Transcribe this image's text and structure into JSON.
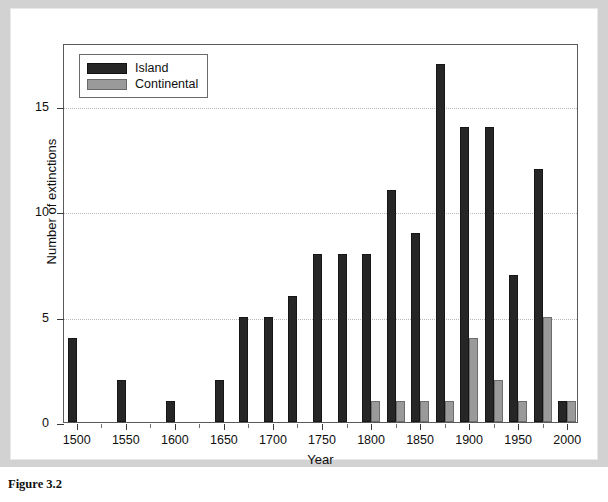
{
  "figure": {
    "caption": "Figure 3.2"
  },
  "chart_data": {
    "type": "bar",
    "title": "",
    "xlabel": "Year",
    "ylabel": "Number of extinctions",
    "ylim": [
      0,
      18
    ],
    "yticks": [
      0,
      5,
      10,
      15
    ],
    "ytick_labels": [
      "0",
      "5",
      "10",
      "15"
    ],
    "xlim": [
      1487,
      2012
    ],
    "xticks": [
      1500,
      1550,
      1600,
      1650,
      1700,
      1750,
      1800,
      1850,
      1900,
      1950,
      2000
    ],
    "xtick_labels": [
      "1500",
      "1550",
      "1600",
      "1650",
      "1700",
      "1750",
      "1800",
      "1850",
      "1900",
      "1950",
      "2000"
    ],
    "xminor_ticks": [
      1525,
      1575,
      1625,
      1675,
      1725,
      1775,
      1825,
      1875,
      1925,
      1975
    ],
    "grid": "horizontal-dotted",
    "legend_position": "top-left",
    "bin_width": 25,
    "categories": [
      1500,
      1525,
      1550,
      1575,
      1600,
      1625,
      1650,
      1675,
      1700,
      1725,
      1750,
      1775,
      1800,
      1825,
      1850,
      1875,
      1900,
      1925,
      1950,
      1975,
      2000
    ],
    "series": [
      {
        "name": "Island",
        "color": "#262626",
        "values": [
          4,
          0,
          2,
          0,
          1,
          0,
          2,
          5,
          5,
          6,
          8,
          8,
          8,
          11,
          9,
          17,
          14,
          14,
          7,
          12,
          1
        ]
      },
      {
        "name": "Continental",
        "color": "#9a9a9a",
        "values": [
          0,
          0,
          0,
          0,
          0,
          0,
          0,
          0,
          0,
          0,
          0,
          0,
          1,
          1,
          1,
          1,
          4,
          2,
          1,
          5,
          1
        ]
      }
    ]
  },
  "legend": {
    "entries": [
      {
        "label": "Island",
        "swatch": "island-swatch"
      },
      {
        "label": "Continental",
        "swatch": "continental-swatch"
      }
    ]
  }
}
